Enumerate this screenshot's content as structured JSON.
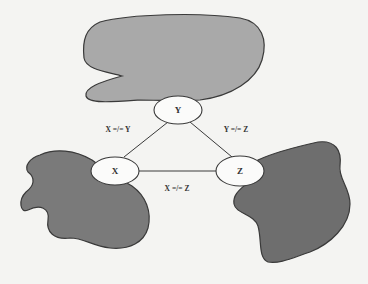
{
  "diagram": {
    "type": "constraint-graph",
    "nodes": [
      {
        "id": "Y",
        "label": "Y"
      },
      {
        "id": "X",
        "label": "X"
      },
      {
        "id": "Z",
        "label": "Z"
      }
    ],
    "edges": [
      {
        "from": "X",
        "to": "Y",
        "label": "X =/= Y"
      },
      {
        "from": "Y",
        "to": "Z",
        "label": "Y =/= Z"
      },
      {
        "from": "X",
        "to": "Z",
        "label": "X =/= Z"
      }
    ],
    "regions": [
      {
        "name": "top-region",
        "attached_to": "Y",
        "color": "#a9a9a9"
      },
      {
        "name": "left-region",
        "attached_to": "X",
        "color": "#7a7a7a"
      },
      {
        "name": "right-region",
        "attached_to": "Z",
        "color": "#6e6e6e"
      }
    ],
    "colors": {
      "background": "#f4f4f2",
      "outline": "#3a3a3a",
      "node_fill": "#fbfbfa"
    }
  }
}
